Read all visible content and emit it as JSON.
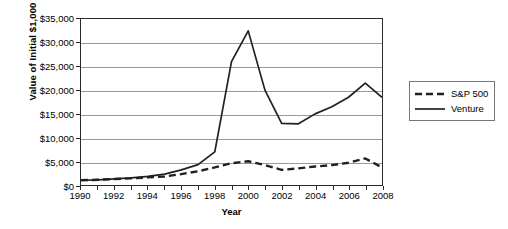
{
  "chart_data": {
    "type": "line",
    "title": "",
    "xlabel": "Year",
    "ylabel": "Value of Initial $1,000",
    "xlim": [
      1990,
      2008
    ],
    "ylim": [
      0,
      35000
    ],
    "grid": true,
    "legend_position": "right",
    "ytick_labels": [
      "$35,000",
      "$30,000",
      "$25,000",
      "$20,000",
      "$15,000",
      "$10,000",
      "$5,000",
      "$0"
    ],
    "ytick_values": [
      35000,
      30000,
      25000,
      20000,
      15000,
      10000,
      5000,
      0
    ],
    "xtick_labels": [
      "1990",
      "1992",
      "1994",
      "1996",
      "1998",
      "2000",
      "2002",
      "2004",
      "2006",
      "2008"
    ],
    "xtick_values": [
      1990,
      1992,
      1994,
      1996,
      1998,
      2000,
      2002,
      2004,
      2006,
      2008
    ],
    "x": [
      1990,
      1991,
      1992,
      1993,
      1994,
      1995,
      1996,
      1997,
      1998,
      1999,
      2000,
      2001,
      2002,
      2003,
      2004,
      2005,
      2006,
      2007,
      2008
    ],
    "series": [
      {
        "name": "S&P 500",
        "style": "dashed",
        "color": "#231f20",
        "values": [
          1000,
          1100,
          1250,
          1400,
          1600,
          1800,
          2300,
          2900,
          3700,
          4600,
          5000,
          4200,
          3200,
          3500,
          3900,
          4200,
          4700,
          5600,
          3700
        ]
      },
      {
        "name": "Venture",
        "style": "solid",
        "color": "#231f20",
        "values": [
          1000,
          1100,
          1300,
          1500,
          1800,
          2300,
          3200,
          4300,
          7000,
          26000,
          32500,
          20000,
          13000,
          12900,
          15000,
          16500,
          18500,
          21500,
          18500
        ]
      }
    ]
  },
  "legend": {
    "items": [
      {
        "label": "S&P 500",
        "style": "dashed"
      },
      {
        "label": "Venture",
        "style": "solid"
      }
    ]
  }
}
